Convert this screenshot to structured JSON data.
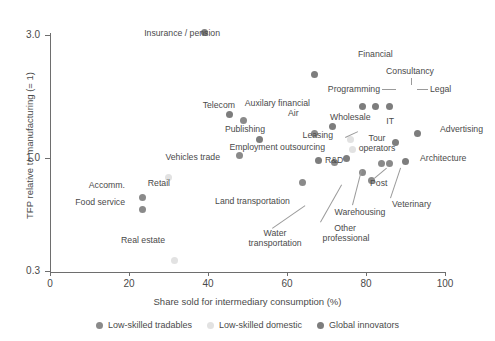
{
  "chart_data": {
    "type": "scatter",
    "title": "",
    "xlabel": "Share sold for intermediary consumption (%)",
    "ylabel": "TFP relative to manufacturing (= 1)",
    "xlim": [
      0,
      100
    ],
    "ylim": [
      0.3,
      3.4
    ],
    "yscale": "log",
    "xticks": [
      0,
      20,
      40,
      60,
      80,
      100
    ],
    "xticklabels": [
      "0",
      "20",
      "40",
      "60",
      "80",
      "100"
    ],
    "yticks": [
      3.0,
      1.0,
      0.3
    ],
    "yticklabels": [
      "3.0",
      "1.0",
      "0.3"
    ],
    "grid": false,
    "legend_position": "bottom",
    "series": [
      {
        "name": "Low-skilled tradables",
        "color": "#8a8a8a",
        "points": [
          {
            "label": "Air",
            "x": 49.0,
            "y": 1.4
          },
          {
            "label": "Wholesale",
            "x": 67.0,
            "y": 1.25
          },
          {
            "label": "Vehicles trade",
            "x": 48.0,
            "y": 1.02
          },
          {
            "label": "Accomm.",
            "x": 23.5,
            "y": 0.7
          },
          {
            "label": "Food service",
            "x": 23.5,
            "y": 0.63
          },
          {
            "label": "Land transportation",
            "x": 64.0,
            "y": 0.8
          },
          {
            "label": "Water transportation",
            "x": 72.0,
            "y": 0.96
          },
          {
            "label": "Warehousing",
            "x": 79.0,
            "y": 0.88
          },
          {
            "label": "Post",
            "x": 84.0,
            "y": 0.95
          },
          {
            "label": "Veterinary",
            "x": 86.0,
            "y": 0.95
          },
          {
            "label": "Other professional",
            "x": 81.5,
            "y": 0.82
          }
        ]
      },
      {
        "name": "Low-skilled domestic",
        "color": "#e2e2e2",
        "points": [
          {
            "label": "Retail",
            "x": 30.0,
            "y": 0.84
          },
          {
            "label": "Real estate",
            "x": 31.5,
            "y": 0.4
          },
          {
            "label": "Leasing",
            "x": 76.0,
            "y": 1.18
          },
          {
            "label": "Tour operators",
            "x": 76.5,
            "y": 1.08
          }
        ]
      },
      {
        "name": "Global innovators",
        "color": "#7d7d7d",
        "points": [
          {
            "label": "Insurance / pension",
            "x": 39.0,
            "y": 3.08
          },
          {
            "label": "Financial",
            "x": 67.0,
            "y": 2.1
          },
          {
            "label": "Consultancy",
            "x": 82.5,
            "y": 1.58
          },
          {
            "label": "Programming",
            "x": 79.0,
            "y": 1.58
          },
          {
            "label": "Legal",
            "x": 86.0,
            "y": 1.58
          },
          {
            "label": "Auxilary financial",
            "x": 71.5,
            "y": 1.33
          },
          {
            "label": "Telecom",
            "x": 45.5,
            "y": 1.47
          },
          {
            "label": "Publishing",
            "x": 53.0,
            "y": 1.18
          },
          {
            "label": "IT",
            "x": 87.5,
            "y": 1.15
          },
          {
            "label": "Advertising",
            "x": 93.0,
            "y": 1.24
          },
          {
            "label": "Architecture",
            "x": 90.0,
            "y": 0.97
          },
          {
            "label": "Employment outsourcing",
            "x": 75.0,
            "y": 1.0
          },
          {
            "label": "R&D",
            "x": 68.0,
            "y": 0.98
          }
        ]
      }
    ],
    "annotations": [
      "Insurance / pension",
      "Financial",
      "Consultancy",
      "Programming",
      "Legal",
      "Telecom",
      "Air",
      "Auxilary financial",
      "Wholesale",
      "IT",
      "Advertising",
      "Publishing",
      "Leasing",
      "Tour operators",
      "Architecture",
      "Employment outsourcing",
      "R&D",
      "Vehicles trade",
      "Retail",
      "Accomm.",
      "Food service",
      "Land transportation",
      "Post",
      "Veterinary",
      "Warehousing",
      "Water transportation",
      "Other professional",
      "Real estate"
    ]
  },
  "legend": {
    "items": [
      {
        "label": "Low-skilled tradables",
        "color": "#8a8a8a"
      },
      {
        "label": "Low-skilled domestic",
        "color": "#e2e2e2"
      },
      {
        "label": "Global innovators",
        "color": "#7d7d7d"
      }
    ]
  },
  "labels": {
    "insurance": "Insurance / pension",
    "financial": "Financial",
    "consultancy": "Consultancy",
    "programming": "Programming",
    "legal": "Legal",
    "telecom": "Telecom",
    "air": "Air",
    "auxilary": "Auxilary financial",
    "wholesale": "Wholesale",
    "it": "IT",
    "advertising": "Advertising",
    "publishing": "Publishing",
    "leasing": "Leasing",
    "tour": "Tour",
    "operators": "operators",
    "architecture": "Architecture",
    "employment": "Employment outsourcing",
    "rnd": "R&D",
    "vehicles": "Vehicles trade",
    "retail": "Retail",
    "accomm": "Accomm.",
    "foodservice": "Food service",
    "land": "Land transportation",
    "post": "Post",
    "veterinary": "Veterinary",
    "warehousing": "Warehousing",
    "water1": "Water",
    "water2": "transportation",
    "other1": "Other",
    "other2": "professional",
    "realestate": "Real estate"
  },
  "axes": {
    "x_title": "Share sold for intermediary consumption (%)",
    "y_title": "TFP relative to manufacturing (= 1)",
    "x_ticks": [
      "0",
      "20",
      "40",
      "60",
      "80",
      "100"
    ],
    "y_ticks": [
      "3.0",
      "1.0",
      "0.3"
    ]
  }
}
